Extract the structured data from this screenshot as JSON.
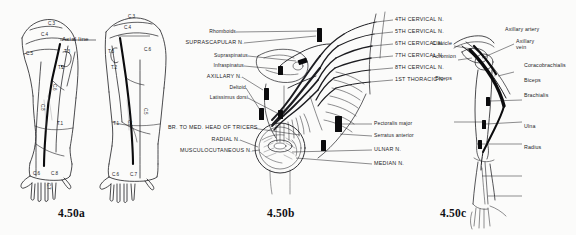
{
  "figure": {
    "background_color": "#fbfbfa",
    "ink_color": "#1b1b1f"
  },
  "panels": [
    {
      "id": "a",
      "caption": "4.50a",
      "description": "Dermatome maps of anterior and posterior upper limb with axial line",
      "axial_line_label": "Axial line",
      "dermatomes_left_arm": [
        "C.3",
        "C.4",
        "C.5",
        "T.3",
        "T.2",
        "C.6",
        "C.8",
        "T.1",
        "C.6",
        "C.8",
        "C.7"
      ],
      "dermatomes_right_arm": [
        "C.3",
        "C.4",
        "C.6",
        "T.3",
        "T.2",
        "C.5",
        "T.1",
        "C.8",
        "C.6",
        "C.7"
      ]
    },
    {
      "id": "b",
      "caption": "4.50b",
      "description": "Brachial plexus branches with muscle supply",
      "labels_left": [
        "Rhomboids",
        "SUPRASCAPULAR N.",
        "Supraspinatus",
        "Infraspinatus",
        "AXILLARY N.",
        "Deltoid",
        "Latissimus dorsi",
        "BR. TO MED. HEAD OF TRICEPS",
        "RADIAL N.",
        "MUSCULOCUTANEOUS N."
      ],
      "labels_right_roots": [
        "4TH CERVICAL N.",
        "5TH CERVICAL N.",
        "6TH CERVICAL N.",
        "7TH CERVICAL N.",
        "8TH CERVICAL N.",
        "1ST THORACIC N."
      ],
      "labels_right_lower": [
        "Pectoralis major",
        "Serratus anterior",
        "ULNAR N.",
        "MEDIAN N."
      ]
    },
    {
      "id": "c",
      "caption": "4.50c",
      "description": "Axillary vessels and arm skeleton with muscle attachments",
      "labels_right": [
        "Axillary artery",
        "Axillary vein",
        "Coracobrachialis",
        "Biceps",
        "Brachialis",
        "Ulna",
        "Radius"
      ],
      "labels_left": [
        "Clavicle",
        "Acromion",
        "Biceps"
      ]
    }
  ]
}
